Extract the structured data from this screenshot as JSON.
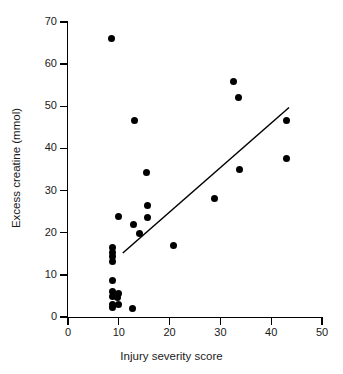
{
  "chart_data": {
    "type": "scatter",
    "title": "",
    "xlabel": "Injury severity score",
    "ylabel": "Excess creatine (mmol)",
    "xlim": [
      0,
      50
    ],
    "ylim": [
      0,
      70
    ],
    "xticks": [
      0,
      10,
      20,
      30,
      40,
      50
    ],
    "yticks": [
      0,
      10,
      20,
      30,
      40,
      50,
      60,
      70
    ],
    "grid": false,
    "legend": null,
    "marker": {
      "shape": "circle",
      "color": "#000000",
      "size": 7
    },
    "points": [
      {
        "x": 8.6,
        "y": 66.0
      },
      {
        "x": 32.5,
        "y": 56.0
      },
      {
        "x": 33.6,
        "y": 52.0
      },
      {
        "x": 13.0,
        "y": 46.6
      },
      {
        "x": 43.0,
        "y": 46.6
      },
      {
        "x": 43.0,
        "y": 37.5
      },
      {
        "x": 33.7,
        "y": 35.0
      },
      {
        "x": 15.4,
        "y": 34.2
      },
      {
        "x": 28.8,
        "y": 28.1
      },
      {
        "x": 15.6,
        "y": 26.4
      },
      {
        "x": 9.9,
        "y": 23.8
      },
      {
        "x": 15.7,
        "y": 23.6
      },
      {
        "x": 12.8,
        "y": 21.9
      },
      {
        "x": 14.0,
        "y": 19.8
      },
      {
        "x": 20.8,
        "y": 17.0
      },
      {
        "x": 8.8,
        "y": 16.6
      },
      {
        "x": 8.8,
        "y": 15.4
      },
      {
        "x": 8.8,
        "y": 14.3
      },
      {
        "x": 8.8,
        "y": 13.1
      },
      {
        "x": 8.8,
        "y": 8.7
      },
      {
        "x": 8.7,
        "y": 6.0
      },
      {
        "x": 9.9,
        "y": 5.6
      },
      {
        "x": 8.7,
        "y": 4.8
      },
      {
        "x": 9.8,
        "y": 4.6
      },
      {
        "x": 8.7,
        "y": 3.0
      },
      {
        "x": 10.0,
        "y": 3.0
      },
      {
        "x": 8.8,
        "y": 2.2
      },
      {
        "x": 12.7,
        "y": 2.0
      }
    ],
    "trend_line": {
      "type": "linear-regression",
      "x_start": 10.9,
      "y_start": 15.3,
      "x_end": 43.4,
      "y_end": 49.6,
      "color": "#000000",
      "width": 1.5
    }
  }
}
